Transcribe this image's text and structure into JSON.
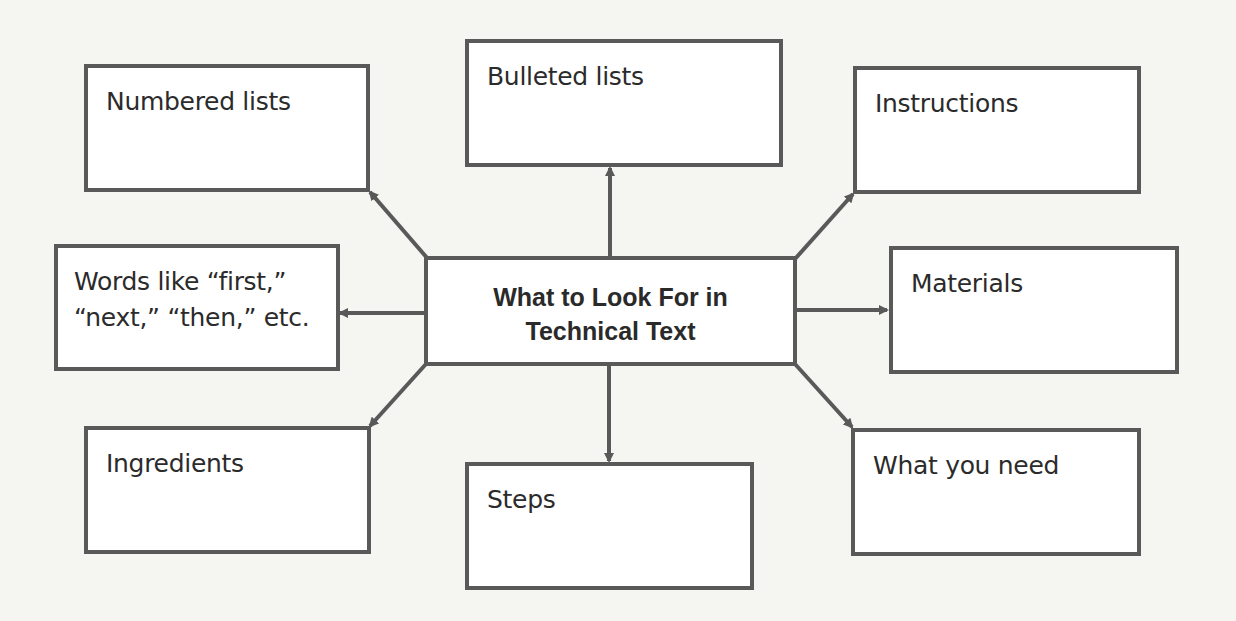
{
  "diagram": {
    "type": "concept-web",
    "center": {
      "label": "What to Look For in\nTechnical Text"
    },
    "nodes": [
      {
        "id": "numbered-lists",
        "label": "Numbered lists"
      },
      {
        "id": "bulleted-lists",
        "label": "Bulleted lists"
      },
      {
        "id": "instructions",
        "label": "Instructions"
      },
      {
        "id": "words-like",
        "label": "Words like “first,”\n“next,” “then,” etc."
      },
      {
        "id": "materials",
        "label": "Materials"
      },
      {
        "id": "ingredients",
        "label": "Ingredients"
      },
      {
        "id": "steps",
        "label": "Steps"
      },
      {
        "id": "what-you-need",
        "label": "What you need"
      }
    ],
    "edges": [
      {
        "from": "center",
        "to": "numbered-lists"
      },
      {
        "from": "center",
        "to": "bulleted-lists"
      },
      {
        "from": "center",
        "to": "instructions"
      },
      {
        "from": "center",
        "to": "words-like"
      },
      {
        "from": "center",
        "to": "materials"
      },
      {
        "from": "center",
        "to": "ingredients"
      },
      {
        "from": "center",
        "to": "steps"
      },
      {
        "from": "center",
        "to": "what-you-need"
      }
    ],
    "colors": {
      "border": "#595959",
      "arrow": "#595959",
      "text": "#2b2b2b",
      "background": "#f5f5f2"
    }
  }
}
